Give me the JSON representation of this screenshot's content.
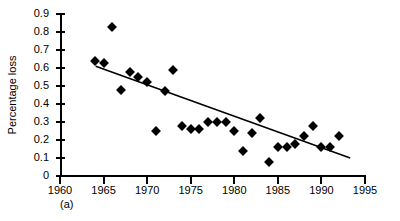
{
  "figure": {
    "panel_label": "(a)",
    "axis_color": "#000000",
    "marker_color": "#000000",
    "trend_color": "#000000",
    "background": "#ffffff"
  },
  "chart_data": {
    "type": "scatter",
    "title": "",
    "subtitle": "",
    "xlabel": "",
    "ylabel": "Percentage loss",
    "xlim": [
      1960,
      1995
    ],
    "ylim": [
      0,
      0.9
    ],
    "xticks": [
      1960,
      1965,
      1970,
      1975,
      1980,
      1985,
      1990,
      1995
    ],
    "xtick_labels": [
      "1960",
      "1965",
      "1970",
      "1975",
      "1980",
      "1985",
      "1990",
      "1995"
    ],
    "yticks": [
      0,
      0.1,
      0.2,
      0.3,
      0.4,
      0.5,
      0.6,
      0.7,
      0.8,
      0.9
    ],
    "ytick_labels": [
      "0",
      "0.1",
      "0.2",
      "0.3",
      "0.4",
      "0.5",
      "0.6",
      "0.7",
      "0.8",
      "0.9"
    ],
    "grid": false,
    "legend": null,
    "legend_position": "none",
    "marker": "diamond",
    "annotations": [
      "(a)"
    ],
    "x": [
      1964,
      1965,
      1966,
      1967,
      1968,
      1969,
      1970,
      1971,
      1972,
      1973,
      1974,
      1975,
      1976,
      1977,
      1978,
      1979,
      1980,
      1981,
      1982,
      1983,
      1984,
      1985,
      1986,
      1987,
      1988,
      1989,
      1990,
      1991,
      1992
    ],
    "y": [
      0.64,
      0.63,
      0.83,
      0.48,
      0.58,
      0.55,
      0.52,
      0.25,
      0.47,
      0.59,
      0.28,
      0.26,
      0.26,
      0.3,
      0.3,
      0.3,
      0.25,
      0.14,
      0.24,
      0.32,
      0.08,
      0.16,
      0.16,
      0.18,
      0.22,
      0.28,
      0.16,
      0.16,
      0.22
    ],
    "series": [
      {
        "name": "Percentage loss",
        "x": [
          1964,
          1965,
          1966,
          1967,
          1968,
          1969,
          1970,
          1971,
          1972,
          1973,
          1974,
          1975,
          1976,
          1977,
          1978,
          1979,
          1980,
          1981,
          1982,
          1983,
          1984,
          1985,
          1986,
          1987,
          1988,
          1989,
          1990,
          1991,
          1992
        ],
        "values": [
          0.64,
          0.63,
          0.83,
          0.48,
          0.58,
          0.55,
          0.52,
          0.25,
          0.47,
          0.59,
          0.28,
          0.26,
          0.26,
          0.3,
          0.3,
          0.3,
          0.25,
          0.14,
          0.24,
          0.32,
          0.08,
          0.16,
          0.16,
          0.18,
          0.22,
          0.28,
          0.16,
          0.16,
          0.22
        ]
      }
    ],
    "trend_line": {
      "type": "linear-fit",
      "x_start": 1964.1,
      "y_start": 0.61,
      "x_end": 1993.3,
      "y_end": 0.1
    }
  }
}
